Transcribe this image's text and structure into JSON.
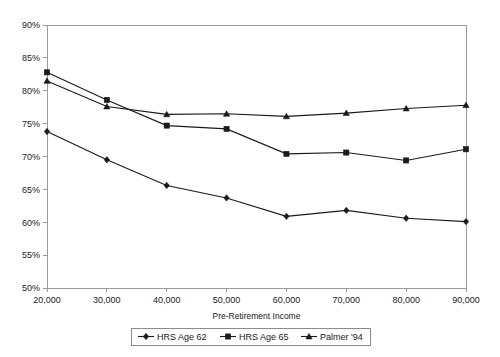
{
  "chart_data": {
    "type": "line",
    "title": "",
    "subtitle": "",
    "xlabel": "Pre-Retirement Income",
    "ylabel": "",
    "x": [
      20000,
      30000,
      40000,
      50000,
      60000,
      70000,
      80000,
      90000
    ],
    "x_tick_labels": [
      "20,000",
      "30,000",
      "40,000",
      "50,000",
      "60,000",
      "70,000",
      "80,000",
      "90,000"
    ],
    "y_tick_labels": [
      "50%",
      "55%",
      "60%",
      "65%",
      "70%",
      "75%",
      "80%",
      "85%",
      "90%"
    ],
    "y_tick_values": [
      50,
      55,
      60,
      65,
      70,
      75,
      80,
      85,
      90
    ],
    "xlim": [
      20000,
      90000
    ],
    "ylim": [
      50,
      90
    ],
    "grid": false,
    "legend_position": "bottom",
    "series": [
      {
        "name": "HRS Age 62",
        "marker": "diamond",
        "values": [
          73.8,
          69.5,
          65.6,
          63.7,
          60.9,
          61.8,
          60.6,
          60.1
        ]
      },
      {
        "name": "HRS Age 65",
        "marker": "square",
        "values": [
          82.8,
          78.6,
          74.7,
          74.2,
          70.4,
          70.6,
          69.4,
          71.1
        ]
      },
      {
        "name": "Palmer '94",
        "marker": "triangle",
        "values": [
          81.5,
          77.6,
          76.4,
          76.5,
          76.1,
          76.6,
          77.3,
          77.8
        ]
      }
    ]
  },
  "legend": {
    "entries": [
      {
        "label": "HRS Age 62"
      },
      {
        "label": "HRS Age 65"
      },
      {
        "label": "Palmer '94"
      }
    ]
  },
  "colors": {
    "line": "#1a1a1a",
    "axis": "#9a9a9a",
    "background": "#ffffff"
  }
}
